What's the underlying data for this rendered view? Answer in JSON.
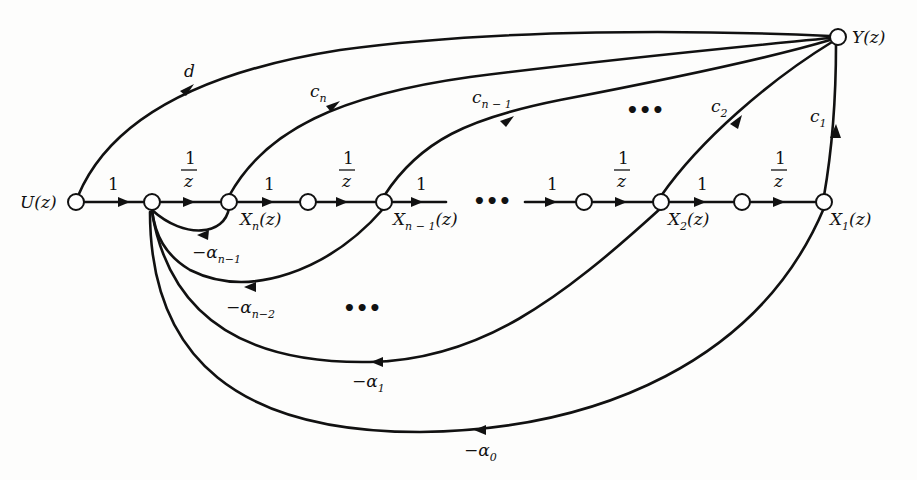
{
  "diagram": {
    "nodes": {
      "input": "U(z)",
      "output": "Y(z)",
      "xn": {
        "main": "X",
        "sub": "n",
        "arg": "(z)"
      },
      "xn1": {
        "main": "X",
        "sub": "n − 1",
        "arg": "(z)"
      },
      "x2": {
        "main": "X",
        "sub": "2",
        "arg": "(z)"
      },
      "x1": {
        "main": "X",
        "sub": "1",
        "arg": "(z)"
      }
    },
    "forward_gains": {
      "one": "1",
      "delay_num": "1",
      "delay_den": "z"
    },
    "output_gains": {
      "d": "d",
      "cn": {
        "main": "c",
        "sub": "n"
      },
      "cn1": {
        "main": "c",
        "sub": "n − 1"
      },
      "c2": {
        "main": "c",
        "sub": "2"
      },
      "c1": {
        "main": "c",
        "sub": "1"
      }
    },
    "feedback_gains": {
      "an1": {
        "main": "−α",
        "sub": "n−1"
      },
      "an2": {
        "main": "−α",
        "sub": "n−2"
      },
      "a1": {
        "main": "−α",
        "sub": "1"
      },
      "a0": {
        "main": "−α",
        "sub": "0"
      }
    },
    "ellipsis": "•••"
  }
}
